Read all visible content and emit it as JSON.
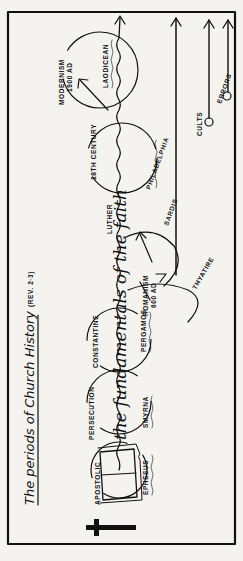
{
  "diagram": {
    "title": "The periods of Church History",
    "reference": "(REV. 2·3)",
    "center_banner": "the fundamentals of the faith",
    "periods": [
      {
        "period": "APOSTOLIC",
        "church": "EPHESUS"
      },
      {
        "period": "PERSECUTION",
        "church": "SMYRNA"
      },
      {
        "period": "CONSTANTINE",
        "church": "PERGAMOS"
      },
      {
        "period": "ROMANISM",
        "date": "600 AD",
        "church": "THYATIRE"
      },
      {
        "period": "LUTHER",
        "church": "SARDIS"
      },
      {
        "period": "18TH CENTURY",
        "church": "PHILADELPHIA"
      },
      {
        "period": "MODERNISM",
        "date": "1900 AD",
        "church": "LAODICEAN"
      }
    ],
    "side_branches": [
      {
        "label": "CULTS"
      },
      {
        "label": "ERRORS"
      }
    ],
    "icons": [
      "cross-icon",
      "open-bible-icon"
    ],
    "colors": {
      "ink": "#111111",
      "paper": "#f4f3ef"
    }
  }
}
